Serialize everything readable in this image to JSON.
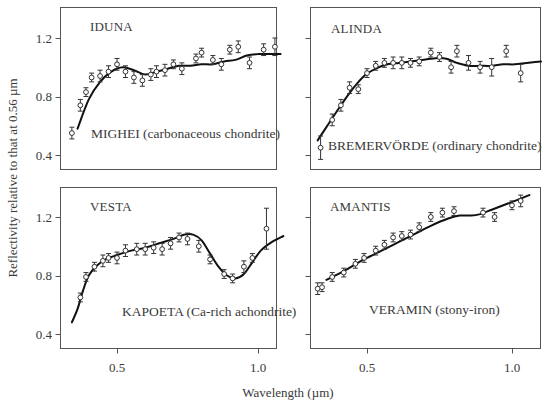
{
  "chart_data": {
    "type": "scatter",
    "title": "",
    "xlabel": "Wavelength (µm)",
    "ylabel": "Reflectivity relative to that at 0.56 µm",
    "xlim": [
      0.33,
      1.12
    ],
    "ylim": [
      0.32,
      1.38
    ],
    "xticks": [
      0.5,
      1.0
    ],
    "xtick_labels": [
      "0.5",
      "1.0"
    ],
    "yticks": [
      0.4,
      0.8,
      1.2
    ],
    "ytick_labels": [
      "0.4",
      "0.8",
      "1.2"
    ],
    "grid": false,
    "legend": "none",
    "layout": "2x2 panels, shared axes",
    "panels": [
      {
        "id": "iduna",
        "asteroid": "IDUNA",
        "meteorite_label": "MIGHEI (carbonaceous chondrite)",
        "asteroid_points": {
          "x": [
            0.34,
            0.37,
            0.39,
            0.41,
            0.44,
            0.47,
            0.5,
            0.53,
            0.56,
            0.59,
            0.62,
            0.64,
            0.67,
            0.7,
            0.73,
            0.78,
            0.8,
            0.84,
            0.87,
            0.9,
            0.93,
            0.97,
            1.02,
            1.06
          ],
          "y": [
            0.55,
            0.74,
            0.83,
            0.93,
            0.94,
            0.97,
            1.02,
            0.97,
            0.93,
            0.91,
            0.95,
            0.97,
            0.98,
            1.02,
            0.99,
            1.06,
            1.1,
            1.05,
            1.02,
            1.12,
            1.14,
            1.03,
            1.12,
            1.14
          ],
          "err": [
            0.04,
            0.04,
            0.03,
            0.03,
            0.04,
            0.04,
            0.04,
            0.04,
            0.04,
            0.04,
            0.04,
            0.04,
            0.04,
            0.03,
            0.04,
            0.03,
            0.03,
            0.03,
            0.04,
            0.03,
            0.04,
            0.04,
            0.04,
            0.06
          ]
        },
        "meteorite_curve": {
          "x": [
            0.36,
            0.4,
            0.44,
            0.48,
            0.52,
            0.56,
            0.6,
            0.64,
            0.68,
            0.72,
            0.76,
            0.8,
            0.84,
            0.88,
            0.92,
            0.96,
            1.0,
            1.04,
            1.08
          ],
          "y": [
            0.58,
            0.78,
            0.9,
            0.97,
            1.0,
            0.98,
            0.95,
            0.97,
            0.99,
            1.01,
            1.01,
            1.02,
            1.02,
            1.04,
            1.05,
            1.08,
            1.09,
            1.09,
            1.09
          ]
        }
      },
      {
        "id": "alinda",
        "asteroid": "ALINDA",
        "meteorite_label": "BREMERVÖRDE (ordinary chondrite)",
        "asteroid_points": {
          "x": [
            0.34,
            0.38,
            0.41,
            0.44,
            0.47,
            0.5,
            0.53,
            0.56,
            0.59,
            0.62,
            0.65,
            0.68,
            0.72,
            0.75,
            0.79,
            0.81,
            0.85,
            0.89,
            0.93,
            0.98,
            1.03
          ],
          "y": [
            0.45,
            0.64,
            0.74,
            0.86,
            0.85,
            0.96,
            1.01,
            1.03,
            1.03,
            1.03,
            1.03,
            1.04,
            1.1,
            1.07,
            1.0,
            1.11,
            1.03,
            1.0,
            1.0,
            1.11,
            0.96
          ],
          "err": [
            0.08,
            0.04,
            0.04,
            0.04,
            0.03,
            0.03,
            0.03,
            0.03,
            0.04,
            0.04,
            0.03,
            0.03,
            0.03,
            0.03,
            0.04,
            0.04,
            0.05,
            0.04,
            0.06,
            0.04,
            0.06
          ]
        },
        "meteorite_curve": {
          "x": [
            0.33,
            0.37,
            0.41,
            0.45,
            0.49,
            0.53,
            0.57,
            0.61,
            0.65,
            0.69,
            0.73,
            0.77,
            0.81,
            0.85,
            0.89,
            0.93,
            0.97,
            1.01,
            1.05,
            1.1
          ],
          "y": [
            0.5,
            0.62,
            0.74,
            0.85,
            0.94,
            0.99,
            1.02,
            1.03,
            1.04,
            1.05,
            1.06,
            1.06,
            1.03,
            1.01,
            1.01,
            1.01,
            1.02,
            1.02,
            1.03,
            1.04
          ]
        }
      },
      {
        "id": "vesta",
        "asteroid": "VESTA",
        "meteorite_label": "KAPOETA (Ca-rich achondrite)",
        "asteroid_points": {
          "x": [
            0.37,
            0.39,
            0.42,
            0.45,
            0.47,
            0.5,
            0.53,
            0.57,
            0.6,
            0.63,
            0.66,
            0.69,
            0.72,
            0.75,
            0.79,
            0.83,
            0.88,
            0.91,
            0.95,
            0.98,
            1.03
          ],
          "y": [
            0.65,
            0.79,
            0.86,
            0.9,
            0.92,
            0.92,
            0.97,
            0.98,
            0.98,
            0.99,
            0.98,
            1.02,
            1.06,
            1.05,
            1.0,
            0.91,
            0.81,
            0.78,
            0.86,
            0.92,
            1.12
          ],
          "err": [
            0.03,
            0.03,
            0.03,
            0.04,
            0.03,
            0.04,
            0.04,
            0.04,
            0.04,
            0.04,
            0.04,
            0.04,
            0.03,
            0.04,
            0.04,
            0.03,
            0.03,
            0.03,
            0.04,
            0.03,
            0.14
          ]
        },
        "meteorite_curve": {
          "x": [
            0.34,
            0.36,
            0.38,
            0.4,
            0.43,
            0.46,
            0.5,
            0.55,
            0.6,
            0.65,
            0.7,
            0.74,
            0.77,
            0.8,
            0.83,
            0.86,
            0.89,
            0.92,
            0.95,
            0.98,
            1.01,
            1.05,
            1.09
          ],
          "y": [
            0.48,
            0.57,
            0.7,
            0.8,
            0.87,
            0.91,
            0.94,
            0.97,
            0.99,
            1.02,
            1.05,
            1.08,
            1.08,
            1.04,
            0.95,
            0.86,
            0.8,
            0.78,
            0.81,
            0.89,
            0.97,
            1.03,
            1.07
          ]
        }
      },
      {
        "id": "amantis",
        "asteroid": "AMANTIS",
        "meteorite_label": "VERAMIN (stony-iron)",
        "asteroid_points": {
          "x": [
            0.33,
            0.345,
            0.38,
            0.42,
            0.46,
            0.49,
            0.53,
            0.56,
            0.59,
            0.62,
            0.65,
            0.68,
            0.72,
            0.76,
            0.8,
            0.9,
            0.94,
            1.0,
            1.03
          ],
          "y": [
            0.71,
            0.72,
            0.79,
            0.82,
            0.88,
            0.92,
            0.97,
            1.01,
            1.06,
            1.07,
            1.08,
            1.13,
            1.2,
            1.23,
            1.24,
            1.23,
            1.2,
            1.28,
            1.31
          ],
          "err": [
            0.04,
            0.03,
            0.03,
            0.03,
            0.03,
            0.03,
            0.03,
            0.03,
            0.03,
            0.03,
            0.03,
            0.03,
            0.03,
            0.03,
            0.03,
            0.03,
            0.03,
            0.03,
            0.04
          ]
        },
        "meteorite_curve": {
          "x": [
            0.36,
            0.42,
            0.48,
            0.54,
            0.6,
            0.66,
            0.72,
            0.78,
            0.82,
            0.86,
            0.89,
            0.93,
            0.97,
            1.01,
            1.06
          ],
          "y": [
            0.77,
            0.83,
            0.9,
            0.96,
            1.02,
            1.08,
            1.14,
            1.19,
            1.21,
            1.21,
            1.22,
            1.25,
            1.28,
            1.31,
            1.35
          ]
        }
      }
    ]
  },
  "axes_text": {
    "xlabel": "Wavelength (µm)",
    "ylabel": "Reflectivity relative to that at 0.56 µm",
    "yticks": [
      "1.2",
      "0.8",
      "0.4"
    ],
    "xticks": [
      "0.5",
      "1.0"
    ]
  },
  "panel_titles": {
    "iduna": "IDUNA",
    "alinda": "ALINDA",
    "vesta": "VESTA",
    "amantis": "AMANTIS"
  },
  "panel_labels": {
    "iduna": "MIGHEI (carbonaceous chondrite)",
    "alinda": "BREMERVÖRDE (ordinary chondrite)",
    "vesta": "KAPOETA (Ca-rich achondrite)",
    "amantis": "VERAMIN (stony-iron)"
  },
  "colors": {
    "curve": "#111111",
    "frame": "#555555",
    "text": "#3a3a3a"
  }
}
